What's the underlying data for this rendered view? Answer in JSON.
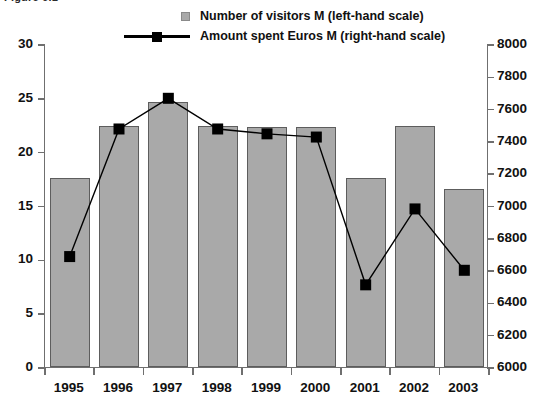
{
  "figure": {
    "caption": "Figure 6.1"
  },
  "legend": {
    "position": "top-center",
    "entries": [
      {
        "key": "bar",
        "swatch": "gray-square-swatch",
        "label": "Number of visitors M (left-hand scale)"
      },
      {
        "key": "line",
        "swatch": "black-line-marker-swatch",
        "label": "Amount spent Euros M (right-hand scale)"
      }
    ]
  },
  "chart_data": {
    "type": "bar",
    "title": "Figure 6.1",
    "xlabel": "",
    "ylabel": "",
    "grid": false,
    "legend_position": "top-center",
    "categories": [
      "1995",
      "1996",
      "1997",
      "1998",
      "1999",
      "2000",
      "2001",
      "2002",
      "2003"
    ],
    "axes": {
      "left": {
        "name": "Number of visitors M",
        "ylim": [
          0,
          30
        ],
        "ticks": [
          0,
          5,
          10,
          15,
          20,
          25,
          30
        ],
        "tick_labels": [
          "0",
          "5",
          "10",
          "15",
          "20",
          "25",
          "30"
        ]
      },
      "right": {
        "name": "Amount spent Euros M",
        "ylim": [
          6000,
          8000
        ],
        "ticks": [
          6000,
          6200,
          6400,
          6600,
          6800,
          7000,
          7200,
          7400,
          7600,
          7800,
          8000
        ],
        "tick_labels": [
          "6000",
          "6200",
          "6400",
          "6600",
          "6800",
          "7000",
          "7200",
          "7400",
          "7600",
          "7800",
          "8000"
        ]
      }
    },
    "series": [
      {
        "name": "Number of visitors M (left-hand scale)",
        "type": "bar",
        "axis": "left",
        "color": "#a9a9a9",
        "values": [
          17.6,
          22.4,
          24.6,
          22.4,
          22.3,
          22.3,
          17.6,
          22.4,
          16.5
        ]
      },
      {
        "name": "Amount spent Euros M (right-hand scale)",
        "type": "line",
        "axis": "right",
        "color": "#000000",
        "marker": "square",
        "values": [
          6690,
          7480,
          7670,
          7480,
          7450,
          7430,
          6515,
          6985,
          6605
        ]
      }
    ]
  }
}
